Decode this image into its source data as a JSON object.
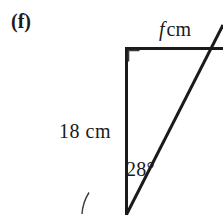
{
  "figure": {
    "part_label": "(f)",
    "shape": "right-triangle",
    "stroke_color": "#1a1a1a",
    "background_color": "#ffffff",
    "labels": {
      "top_side_variable": "f",
      "top_side_unit": "cm",
      "left_side": "18 cm",
      "angle": "28°"
    },
    "geometry": {
      "right_angle_vertex": "top-left",
      "right_angle_marker_size_px": 11,
      "vertical_side_x_px": 126,
      "vertical_side_top_y_px": 48,
      "vertical_side_bottom_y_px": 214,
      "top_side_y_px": 48,
      "top_side_from_x_px": 126,
      "top_side_to_x_px": 223,
      "hypotenuse_from": "126,214",
      "hypotenuse_to": "223,24",
      "angle_arc_radius_px": 44
    }
  }
}
